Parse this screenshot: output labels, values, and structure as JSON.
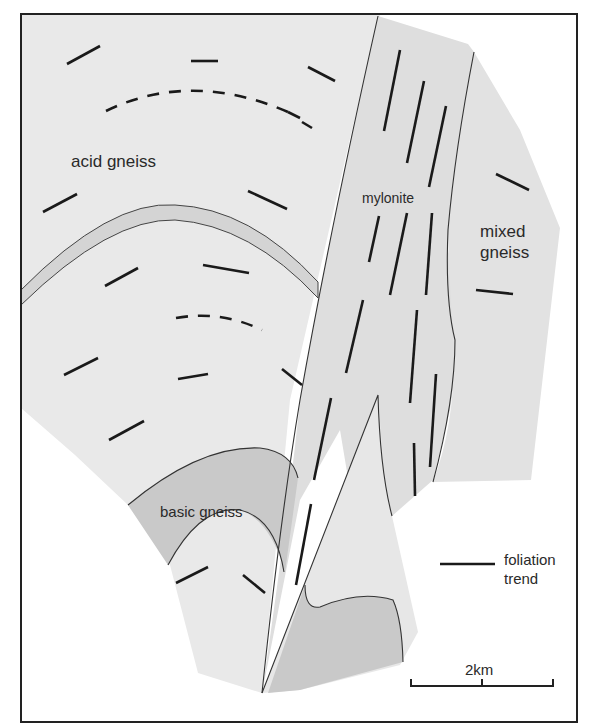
{
  "map": {
    "units": [
      {
        "id": "acid_gneiss",
        "label": "acid gneiss",
        "fill": "#e9e9e9"
      },
      {
        "id": "mylonite",
        "label": "mylonite",
        "fill": "#dedede"
      },
      {
        "id": "mixed_gneiss",
        "label": "mixed gneiss",
        "label_lines": [
          "mixed",
          "gneiss"
        ],
        "fill": "#e2e2e2"
      },
      {
        "id": "basic_gneiss",
        "label": "basic gneiss",
        "fill": "#c9c9c9"
      }
    ],
    "labels": {
      "acid_gneiss": "acid gneiss",
      "mylonite": "mylonite",
      "mixed_line1": "mixed",
      "mixed_line2": "gneiss",
      "basic_gneiss": "basic gneiss"
    },
    "legend": {
      "symbol": "foliation-trend-line",
      "line1": "foliation",
      "line2": "trend"
    },
    "scale_bar": {
      "label": "2km"
    },
    "colors": {
      "frame": "#222222",
      "acid_gneiss": "#e9e9e9",
      "mylonite": "#dedede",
      "mixed_gneiss": "#e2e2e2",
      "basic_gneiss": "#c9c9c9",
      "band": "#d4d4d4",
      "trend_line": "#1a1a1a"
    }
  }
}
